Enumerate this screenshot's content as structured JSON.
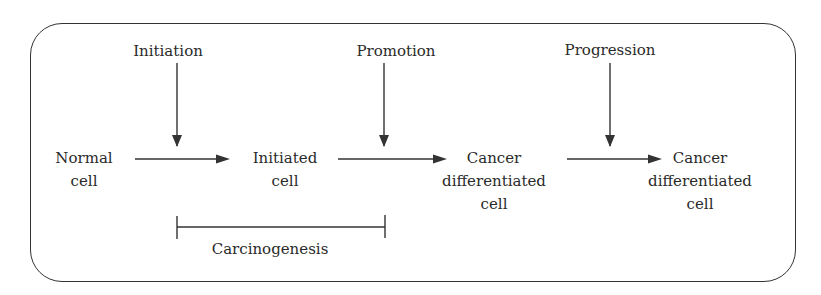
{
  "diagram": {
    "stages": [
      {
        "id": "initiation",
        "label": "Initiation"
      },
      {
        "id": "promotion",
        "label": "Promotion"
      },
      {
        "id": "progression",
        "label": "Progression"
      }
    ],
    "nodes": [
      {
        "id": "normal",
        "line1": "Normal",
        "line2": "cell"
      },
      {
        "id": "initiated",
        "line1": "Initiated",
        "line2": "cell"
      },
      {
        "id": "cancer1",
        "line1": "Cancer",
        "line2": "differentiated",
        "line3": "cell"
      },
      {
        "id": "cancer2",
        "line1": "Cancer",
        "line2": "differentiated",
        "line3": "cell"
      }
    ],
    "edges": [
      {
        "from": "normal",
        "to": "initiated",
        "via": "initiation"
      },
      {
        "from": "initiated",
        "to": "cancer1",
        "via": "promotion"
      },
      {
        "from": "cancer1",
        "to": "cancer2",
        "via": "progression"
      }
    ],
    "bracket": {
      "label": "Carcinogenesis",
      "spans": [
        "initiation",
        "promotion"
      ]
    },
    "colors": {
      "line": "#333333",
      "text": "#2a2a2a",
      "background": "#ffffff"
    }
  }
}
